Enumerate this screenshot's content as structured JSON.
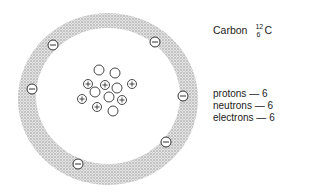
{
  "element": {
    "name": "Carbon",
    "mass_number": "12",
    "atomic_number": "6",
    "symbol": "C"
  },
  "counts": [
    {
      "label": "protons — 6"
    },
    {
      "label": "neutrons — 6"
    },
    {
      "label": "electrons — 6"
    }
  ],
  "diagram": {
    "electron_glyph": "−",
    "proton_glyph": "+",
    "shell_color": "#bcbcbc"
  }
}
